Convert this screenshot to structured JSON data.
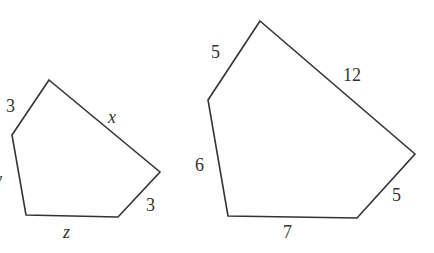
{
  "figure": {
    "stroke_color": "#333333",
    "background": "#ffffff"
  },
  "small_pentagon": {
    "vertices": [
      [
        49,
        80
      ],
      [
        160,
        172
      ],
      [
        118,
        217
      ],
      [
        26,
        215
      ],
      [
        12,
        135
      ]
    ],
    "labels": {
      "top_left_side": "3",
      "top_right_side": "x",
      "right_side": "3",
      "bottom_side": "z",
      "left_side": "y"
    }
  },
  "large_pentagon": {
    "vertices": [
      [
        260,
        21
      ],
      [
        415,
        154
      ],
      [
        357,
        218
      ],
      [
        228,
        216
      ],
      [
        208,
        100
      ]
    ],
    "labels": {
      "top_left_side": "5",
      "top_right_side": "12",
      "right_side": "5",
      "bottom_side": "7",
      "left_side": "6"
    }
  }
}
